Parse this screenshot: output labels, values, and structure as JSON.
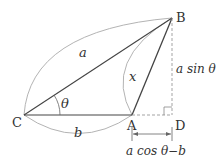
{
  "diagram": {
    "type": "geometry-triangle",
    "points": {
      "C": {
        "label": "C",
        "x": 24,
        "y": 115
      },
      "A": {
        "label": "A",
        "x": 132,
        "y": 115
      },
      "D": {
        "label": "D",
        "x": 172,
        "y": 115
      },
      "B": {
        "label": "B",
        "x": 172,
        "y": 18
      }
    },
    "labels": {
      "side_a": "a",
      "side_b": "b",
      "side_x": "x",
      "angle": "θ",
      "height": "a sin θ",
      "base_ext": "a cos θ−b"
    },
    "colors": {
      "line": "#444444",
      "arc": "#aaaaaa",
      "dashed": "#999999",
      "text": "#333333"
    }
  }
}
